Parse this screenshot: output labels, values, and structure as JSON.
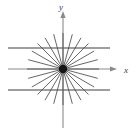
{
  "figure": {
    "width": 137,
    "height": 128,
    "background_color": "#ffffff"
  },
  "axes": {
    "x_axis": {
      "label": "x",
      "label_x": 124,
      "label_y": 73,
      "color": "#8a8a8a",
      "stroke_width": 1.1,
      "x_start": 8,
      "x_end": 114,
      "y": 69,
      "arrow": "right-arrowhead",
      "arrow_x": 114,
      "arrow_y": 69
    },
    "y_axis": {
      "label": "y",
      "label_x": 59,
      "label_y": 10,
      "color": "#8a8a8a",
      "stroke_width": 1.1,
      "y_start": 128,
      "y_end": 14,
      "x": 63,
      "arrow": "up-arrowhead",
      "arrow_x": 63,
      "arrow_y": 14
    }
  },
  "origin": {
    "name": "origin-point",
    "cx": 63,
    "cy": 69,
    "r": 4.2,
    "color": "#151515"
  },
  "rays": {
    "color": "#4a4a4a",
    "stroke_width": 0.85,
    "radius": 36,
    "count": 24,
    "angles_deg": [
      0,
      15,
      30,
      45,
      60,
      75,
      90,
      105,
      120,
      135,
      150,
      165,
      180,
      195,
      210,
      225,
      240,
      255,
      270,
      285,
      300,
      315,
      330,
      345
    ]
  },
  "parallel_lines": {
    "color": "#7e7e7e",
    "stroke_width": 1.3,
    "x_start": 8,
    "x_end": 110,
    "lines": [
      {
        "name": "upper-parallel-line",
        "y": 48
      },
      {
        "name": "lower-parallel-line",
        "y": 90
      }
    ]
  },
  "chart_data": {
    "type": "scatter",
    "xlabel": "x",
    "ylabel": "y",
    "grid": false,
    "legend": null,
    "xlim": [
      -1.6,
      1.6
    ],
    "ylim": [
      -1.5,
      1.5
    ],
    "annotations": [
      "filled point at the origin (0, 0)",
      "24 rays radiating from the origin at 15 degree increments",
      "two horizontal lines parallel to the x-axis, above and below"
    ],
    "series": [
      {
        "name": "origin-point",
        "type": "scatter",
        "x": [
          0
        ],
        "y": [
          0
        ]
      },
      {
        "name": "radial-rays",
        "type": "line",
        "angles_deg": [
          0,
          15,
          30,
          45,
          60,
          75,
          90,
          105,
          120,
          135,
          150,
          165,
          180,
          195,
          210,
          225,
          240,
          255,
          300,
          285,
          270,
          315,
          330,
          345
        ],
        "radius": 36
      },
      {
        "name": "horizontal-parallels",
        "type": "line",
        "y_values": [
          0.62,
          -0.62
        ]
      }
    ]
  }
}
